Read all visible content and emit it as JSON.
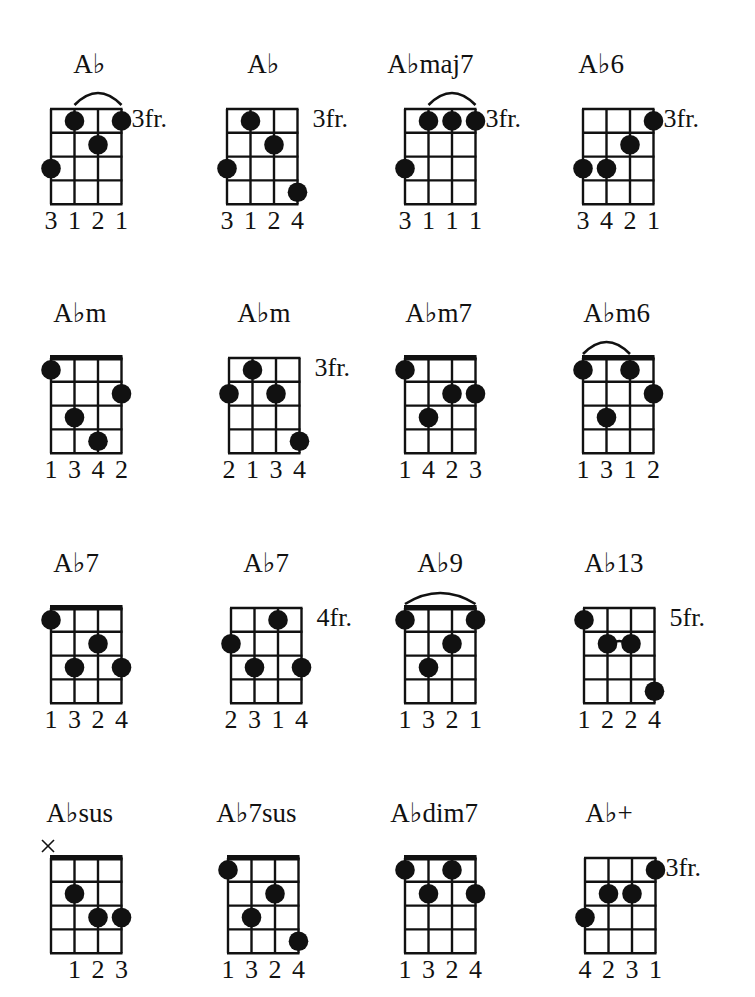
{
  "page": {
    "colors": {
      "ink": "#111111",
      "background": "#ffffff"
    }
  },
  "grid": {
    "strings": 4,
    "frets": 4
  },
  "chords": [
    {
      "name": "A♭",
      "fret_label": "3fr.",
      "nut": false,
      "dots": [
        [
          0,
          3
        ],
        [
          1,
          1
        ],
        [
          2,
          2
        ],
        [
          3,
          1
        ]
      ],
      "barre": {
        "fret": 1,
        "from": 1,
        "to": 3
      },
      "muted": [],
      "fingering": [
        "3",
        "1",
        "2",
        "1"
      ]
    },
    {
      "name": "A♭",
      "fret_label": "3fr.",
      "nut": false,
      "dots": [
        [
          0,
          3
        ],
        [
          1,
          1
        ],
        [
          2,
          2
        ],
        [
          3,
          4
        ]
      ],
      "barre": null,
      "muted": [],
      "fingering": [
        "3",
        "1",
        "2",
        "4"
      ]
    },
    {
      "name": "A♭maj7",
      "fret_label": "3fr.",
      "nut": false,
      "dots": [
        [
          0,
          3
        ],
        [
          1,
          1
        ],
        [
          2,
          1
        ],
        [
          3,
          1
        ]
      ],
      "barre": {
        "fret": 1,
        "from": 1,
        "to": 3
      },
      "muted": [],
      "fingering": [
        "3",
        "1",
        "1",
        "1"
      ]
    },
    {
      "name": "A♭6",
      "fret_label": "3fr.",
      "nut": false,
      "dots": [
        [
          0,
          3
        ],
        [
          1,
          3
        ],
        [
          2,
          2
        ],
        [
          3,
          1
        ]
      ],
      "barre": null,
      "muted": [],
      "fingering": [
        "3",
        "4",
        "2",
        "1"
      ]
    },
    {
      "name": "A♭m",
      "fret_label": "",
      "nut": true,
      "dots": [
        [
          0,
          1
        ],
        [
          1,
          3
        ],
        [
          2,
          4
        ],
        [
          3,
          2
        ]
      ],
      "barre": null,
      "muted": [],
      "fingering": [
        "1",
        "3",
        "4",
        "2"
      ]
    },
    {
      "name": "A♭m",
      "fret_label": "3fr.",
      "nut": false,
      "dots": [
        [
          0,
          2
        ],
        [
          1,
          1
        ],
        [
          2,
          2
        ],
        [
          3,
          4
        ]
      ],
      "barre": null,
      "muted": [],
      "fingering": [
        "2",
        "1",
        "3",
        "4"
      ]
    },
    {
      "name": "A♭m7",
      "fret_label": "",
      "nut": true,
      "dots": [
        [
          0,
          1
        ],
        [
          1,
          3
        ],
        [
          2,
          2
        ],
        [
          3,
          2
        ]
      ],
      "barre": null,
      "muted": [],
      "fingering": [
        "1",
        "4",
        "2",
        "3"
      ]
    },
    {
      "name": "A♭m6",
      "fret_label": "",
      "nut": true,
      "dots": [
        [
          0,
          1
        ],
        [
          1,
          3
        ],
        [
          2,
          1
        ],
        [
          3,
          2
        ]
      ],
      "barre": {
        "fret": 1,
        "from": 0,
        "to": 2
      },
      "muted": [],
      "fingering": [
        "1",
        "3",
        "1",
        "2"
      ]
    },
    {
      "name": "A♭7",
      "fret_label": "",
      "nut": true,
      "dots": [
        [
          0,
          1
        ],
        [
          1,
          3
        ],
        [
          2,
          2
        ],
        [
          3,
          3
        ]
      ],
      "barre": null,
      "muted": [],
      "fingering": [
        "1",
        "3",
        "2",
        "4"
      ]
    },
    {
      "name": "A♭7",
      "fret_label": "4fr.",
      "nut": false,
      "dots": [
        [
          0,
          2
        ],
        [
          1,
          3
        ],
        [
          2,
          1
        ],
        [
          3,
          3
        ]
      ],
      "barre": null,
      "muted": [],
      "fingering": [
        "2",
        "3",
        "1",
        "4"
      ]
    },
    {
      "name": "A♭9",
      "fret_label": "",
      "nut": true,
      "dots": [
        [
          0,
          1
        ],
        [
          1,
          3
        ],
        [
          2,
          2
        ],
        [
          3,
          1
        ]
      ],
      "barre": {
        "fret": 1,
        "from": 0,
        "to": 3
      },
      "muted": [],
      "fingering": [
        "1",
        "3",
        "2",
        "1"
      ]
    },
    {
      "name": "A♭13",
      "fret_label": "5fr.",
      "nut": false,
      "dots": [
        [
          0,
          1
        ],
        [
          1,
          2
        ],
        [
          2,
          2
        ],
        [
          3,
          4
        ]
      ],
      "barre": {
        "fret": 2,
        "from": 1,
        "to": 2,
        "inner": true
      },
      "muted": [],
      "fingering": [
        "1",
        "2",
        "2",
        "4"
      ]
    },
    {
      "name": "A♭sus",
      "fret_label": "",
      "nut": true,
      "dots": [
        [
          1,
          2
        ],
        [
          2,
          3
        ],
        [
          3,
          3
        ]
      ],
      "barre": null,
      "muted": [
        0
      ],
      "fingering": [
        "",
        "1",
        "2",
        "3"
      ]
    },
    {
      "name": "A♭7sus",
      "fret_label": "",
      "nut": true,
      "dots": [
        [
          0,
          1
        ],
        [
          1,
          3
        ],
        [
          2,
          2
        ],
        [
          3,
          4
        ]
      ],
      "barre": null,
      "muted": [],
      "fingering": [
        "1",
        "3",
        "2",
        "4"
      ]
    },
    {
      "name": "A♭dim7",
      "fret_label": "",
      "nut": true,
      "dots": [
        [
          0,
          1
        ],
        [
          1,
          2
        ],
        [
          2,
          1
        ],
        [
          3,
          2
        ]
      ],
      "barre": null,
      "muted": [],
      "fingering": [
        "1",
        "3",
        "2",
        "4"
      ]
    },
    {
      "name": "A♭+",
      "fret_label": "3fr.",
      "nut": false,
      "dots": [
        [
          0,
          3
        ],
        [
          1,
          2
        ],
        [
          2,
          2
        ],
        [
          3,
          1
        ]
      ],
      "barre": null,
      "muted": [],
      "fingering": [
        "4",
        "2",
        "3",
        "1"
      ]
    }
  ],
  "layout": {
    "columns_x": [
      51,
      228,
      405,
      583
    ],
    "rows_y": [
      109,
      358,
      608,
      858
    ],
    "name_offsets_x": [
      22,
      20,
      -18,
      -5,
      2,
      8,
      0,
      0,
      2,
      12,
      12,
      0,
      -5,
      -12,
      -15,
      0
    ],
    "custom_positions": {
      "1": [
        227,
        109
      ],
      "3": [
        583,
        109
      ],
      "5": [
        229,
        358
      ],
      "7": [
        583,
        358
      ],
      "9": [
        231,
        608
      ],
      "11": [
        584,
        608
      ],
      "15": [
        585,
        858
      ]
    }
  }
}
